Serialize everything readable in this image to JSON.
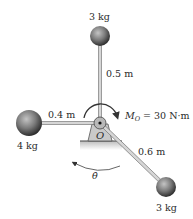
{
  "diagram": {
    "pivot": {
      "label": "O"
    },
    "masses": [
      {
        "id": "top",
        "mass_label": "3 kg",
        "arm_length_label": "0.5 m"
      },
      {
        "id": "left",
        "mass_label": "4 kg",
        "arm_length_label": "0.4 m"
      },
      {
        "id": "lower-right",
        "mass_label": "3 kg",
        "arm_length_label": "0.6 m"
      }
    ],
    "moment": {
      "symbol": "M",
      "subscript": "O",
      "value_text": " = 30 N·m"
    },
    "angular_velocity": {
      "symbol": "θ̇"
    },
    "colors": {
      "sphere_light": "#b5b5b5",
      "sphere_dark": "#3a3a3a",
      "rod": "#cfcfcf",
      "rod_edge": "#6a6a6a",
      "support": "#c8c8c8",
      "ground": "#d0d0d0",
      "line": "#333333"
    }
  }
}
